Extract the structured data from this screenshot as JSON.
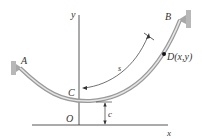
{
  "diagram": {
    "type": "catenary-cable",
    "labels": {
      "A": "A",
      "B": "B",
      "C": "C",
      "O": "O",
      "D": "D(x,y)",
      "s": "s",
      "c": "c",
      "x_axis": "x",
      "y_axis": "y"
    },
    "colors": {
      "cable_outer": "#9a9a9a",
      "cable_inner": "#e6e6e6",
      "axis": "#444444",
      "support": "#b8b8b8",
      "point": "#111111",
      "text": "#333333"
    }
  }
}
